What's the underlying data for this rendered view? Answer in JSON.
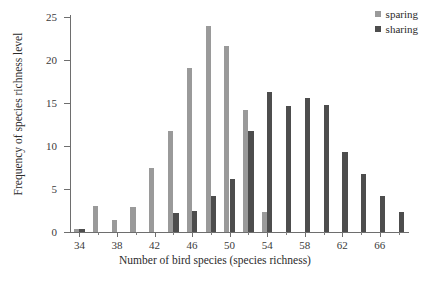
{
  "chart_data": {
    "type": "bar",
    "title": "",
    "xlabel": "Number of bird species (species richness)",
    "ylabel": "Frequency of species richness level",
    "xlim": [
      33,
      69
    ],
    "ylim": [
      0,
      25
    ],
    "grid": false,
    "legend_position": "top-right",
    "x_tick_labels": [
      "34",
      "38",
      "42",
      "46",
      "50",
      "54",
      "58",
      "62",
      "66"
    ],
    "x_tick_values": [
      34,
      38,
      42,
      46,
      50,
      54,
      58,
      62,
      66
    ],
    "x_minor_tick_values": [
      36,
      40,
      44,
      48,
      52,
      56,
      60,
      64,
      68
    ],
    "y_tick_labels": [
      "0",
      "5",
      "10",
      "15",
      "20",
      "25"
    ],
    "y_tick_values": [
      0,
      5,
      10,
      15,
      20,
      25
    ],
    "x": [
      34,
      35,
      36,
      37,
      38,
      39,
      40,
      41,
      42,
      43,
      44,
      45,
      46,
      47,
      48,
      49,
      50,
      51,
      52,
      53,
      54,
      55,
      56,
      57,
      58,
      59,
      60,
      61,
      62,
      63,
      64,
      65,
      66,
      67,
      68
    ],
    "series": [
      {
        "name": "sparing",
        "color": "#9a9a9a",
        "values": [
          0.3,
          0,
          3.0,
          0,
          1.4,
          0,
          2.9,
          0,
          7.4,
          0,
          11.8,
          0,
          19.1,
          0,
          23.9,
          0,
          21.6,
          0,
          14.2,
          0,
          2.3,
          0,
          0,
          0,
          0,
          0,
          0,
          0,
          0,
          0,
          0,
          0,
          0,
          0,
          0
        ]
      },
      {
        "name": "sharing",
        "color": "#4d4d4d",
        "values": [
          0.3,
          0,
          0,
          0,
          0,
          0,
          0,
          0,
          0,
          0,
          2.2,
          0,
          2.4,
          0,
          4.2,
          0,
          6.2,
          0,
          11.8,
          0,
          16.3,
          0,
          14.7,
          0,
          15.6,
          0,
          14.8,
          0,
          9.3,
          0,
          6.8,
          0,
          4.2,
          0,
          2.3
        ]
      }
    ]
  },
  "legend": {
    "items": [
      {
        "label": "sparing",
        "color": "#9a9a9a"
      },
      {
        "label": "sharing",
        "color": "#4d4d4d"
      }
    ]
  },
  "axes": {
    "x_title": "Number of bird species (species richness)",
    "y_title": "Frequency of species richness level"
  }
}
